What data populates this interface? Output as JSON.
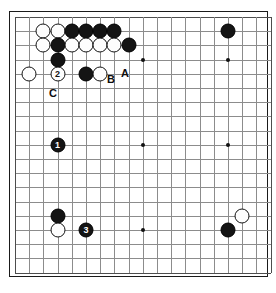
{
  "diagram": {
    "type": "go-board-diagram",
    "board_size": 19,
    "colors": {
      "background": "#ffffff",
      "grid": "#8c8c8c",
      "border": "#1a1a1a",
      "black_stone": "#141414",
      "white_stone": "#fdfdfd",
      "label": "#0d0d0d"
    },
    "geometry": {
      "origin_x": 14,
      "origin_y": 16,
      "spacing": 14.2,
      "stone_diameter": 15
    },
    "star_points": [
      {
        "col": 4,
        "row": 4
      },
      {
        "col": 10,
        "row": 4
      },
      {
        "col": 16,
        "row": 4
      },
      {
        "col": 4,
        "row": 10
      },
      {
        "col": 10,
        "row": 10
      },
      {
        "col": 16,
        "row": 10
      },
      {
        "col": 4,
        "row": 16
      },
      {
        "col": 10,
        "row": 16
      },
      {
        "col": 16,
        "row": 16
      }
    ],
    "stones": [
      {
        "col": 3,
        "row": 2,
        "color": "white",
        "label": ""
      },
      {
        "col": 4,
        "row": 2,
        "color": "white",
        "label": ""
      },
      {
        "col": 5,
        "row": 2,
        "color": "black",
        "label": ""
      },
      {
        "col": 6,
        "row": 2,
        "color": "black",
        "label": ""
      },
      {
        "col": 7,
        "row": 2,
        "color": "black",
        "label": ""
      },
      {
        "col": 8,
        "row": 2,
        "color": "black",
        "label": ""
      },
      {
        "col": 16,
        "row": 2,
        "color": "black",
        "label": ""
      },
      {
        "col": 3,
        "row": 3,
        "color": "white",
        "label": ""
      },
      {
        "col": 4,
        "row": 3,
        "color": "black",
        "label": ""
      },
      {
        "col": 5,
        "row": 3,
        "color": "white",
        "label": ""
      },
      {
        "col": 6,
        "row": 3,
        "color": "white",
        "label": ""
      },
      {
        "col": 7,
        "row": 3,
        "color": "white",
        "label": ""
      },
      {
        "col": 8,
        "row": 3,
        "color": "white",
        "label": ""
      },
      {
        "col": 9,
        "row": 3,
        "color": "black",
        "label": ""
      },
      {
        "col": 4,
        "row": 4,
        "color": "black",
        "label": ""
      },
      {
        "col": 2,
        "row": 5,
        "color": "white",
        "label": ""
      },
      {
        "col": 4,
        "row": 5,
        "color": "white",
        "label": "2"
      },
      {
        "col": 6,
        "row": 5,
        "color": "black",
        "label": ""
      },
      {
        "col": 7,
        "row": 5,
        "color": "white",
        "label": ""
      },
      {
        "col": 4,
        "row": 10,
        "color": "black",
        "label": "1"
      },
      {
        "col": 4,
        "row": 15,
        "color": "black",
        "label": ""
      },
      {
        "col": 17,
        "row": 15,
        "color": "white",
        "label": ""
      },
      {
        "col": 4,
        "row": 16,
        "color": "white",
        "label": ""
      },
      {
        "col": 6,
        "row": 16,
        "color": "black",
        "label": "3"
      },
      {
        "col": 16,
        "row": 16,
        "color": "black",
        "label": ""
      }
    ],
    "annotations": [
      {
        "text": "A",
        "x": 124,
        "y": 72
      },
      {
        "text": "B",
        "x": 110,
        "y": 78
      },
      {
        "text": "C",
        "x": 52,
        "y": 92
      }
    ],
    "move_labels": [
      "1",
      "2",
      "3"
    ],
    "point_labels": [
      "A",
      "B",
      "C"
    ]
  }
}
